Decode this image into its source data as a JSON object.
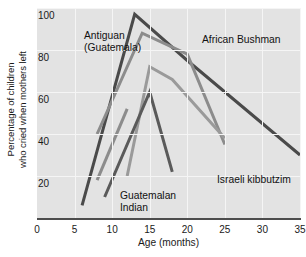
{
  "chart_data": {
    "type": "line",
    "title": "",
    "xlabel": "Age (months)",
    "ylabel_line1": "Percentage of children",
    "ylabel_line2": "who cried when mothers left",
    "xlim": [
      0,
      35
    ],
    "ylim": [
      0,
      100
    ],
    "xticks": [
      0,
      5,
      10,
      15,
      20,
      25,
      30,
      35
    ],
    "xtick_labels": [
      "0",
      "5",
      "10",
      "15",
      "20",
      "25",
      "30",
      "35"
    ],
    "yticks": [
      20,
      40,
      60,
      80,
      100
    ],
    "ytick_labels": [
      "20",
      "40",
      "60",
      "80",
      "100"
    ],
    "grid": "both",
    "legend_position": "inline-annotations",
    "plot_background": "#e3e3e3",
    "series": [
      {
        "name": "African Bushman",
        "color": "#4a4a4a",
        "x": [
          6,
          13,
          20,
          35
        ],
        "y": [
          6,
          97,
          75,
          30
        ]
      },
      {
        "name": "Antiguan (Guatemala)",
        "color": "#8c8c8c",
        "x": [
          8,
          14,
          20,
          25
        ],
        "y": [
          40,
          88,
          78,
          35
        ]
      },
      {
        "name": "Israeli kibbutzim",
        "color": "#9a9a9a",
        "x": [
          12,
          15,
          18,
          25
        ],
        "y": [
          20,
          72,
          66,
          38
        ]
      },
      {
        "name": "Guatemalan Indian",
        "color": "#5a5a5a",
        "x": [
          9,
          15,
          18
        ],
        "y": [
          10,
          60,
          22
        ]
      },
      {
        "name": "unlabeled-short-segment",
        "color": "#8c8c8c",
        "x": [
          8,
          12
        ],
        "y": [
          18,
          52
        ]
      }
    ],
    "annotations": [
      {
        "name": "antiguan-label",
        "text_line1": "Antiguan",
        "text_line2": "(Guatemala)",
        "x_px": 84,
        "y_px": 30
      },
      {
        "name": "african-bushman-label",
        "text_line1": "African Bushman",
        "text_line2": "",
        "x_px": 202,
        "y_px": 34
      },
      {
        "name": "israeli-kibbutzim-label",
        "text_line1": "Israeli kibbutzim",
        "text_line2": "",
        "x_px": 217,
        "y_px": 174
      },
      {
        "name": "guatemalan-indian-label",
        "text_line1": "Guatemalan",
        "text_line2": "Indian",
        "x_px": 120,
        "y_px": 190
      }
    ]
  }
}
